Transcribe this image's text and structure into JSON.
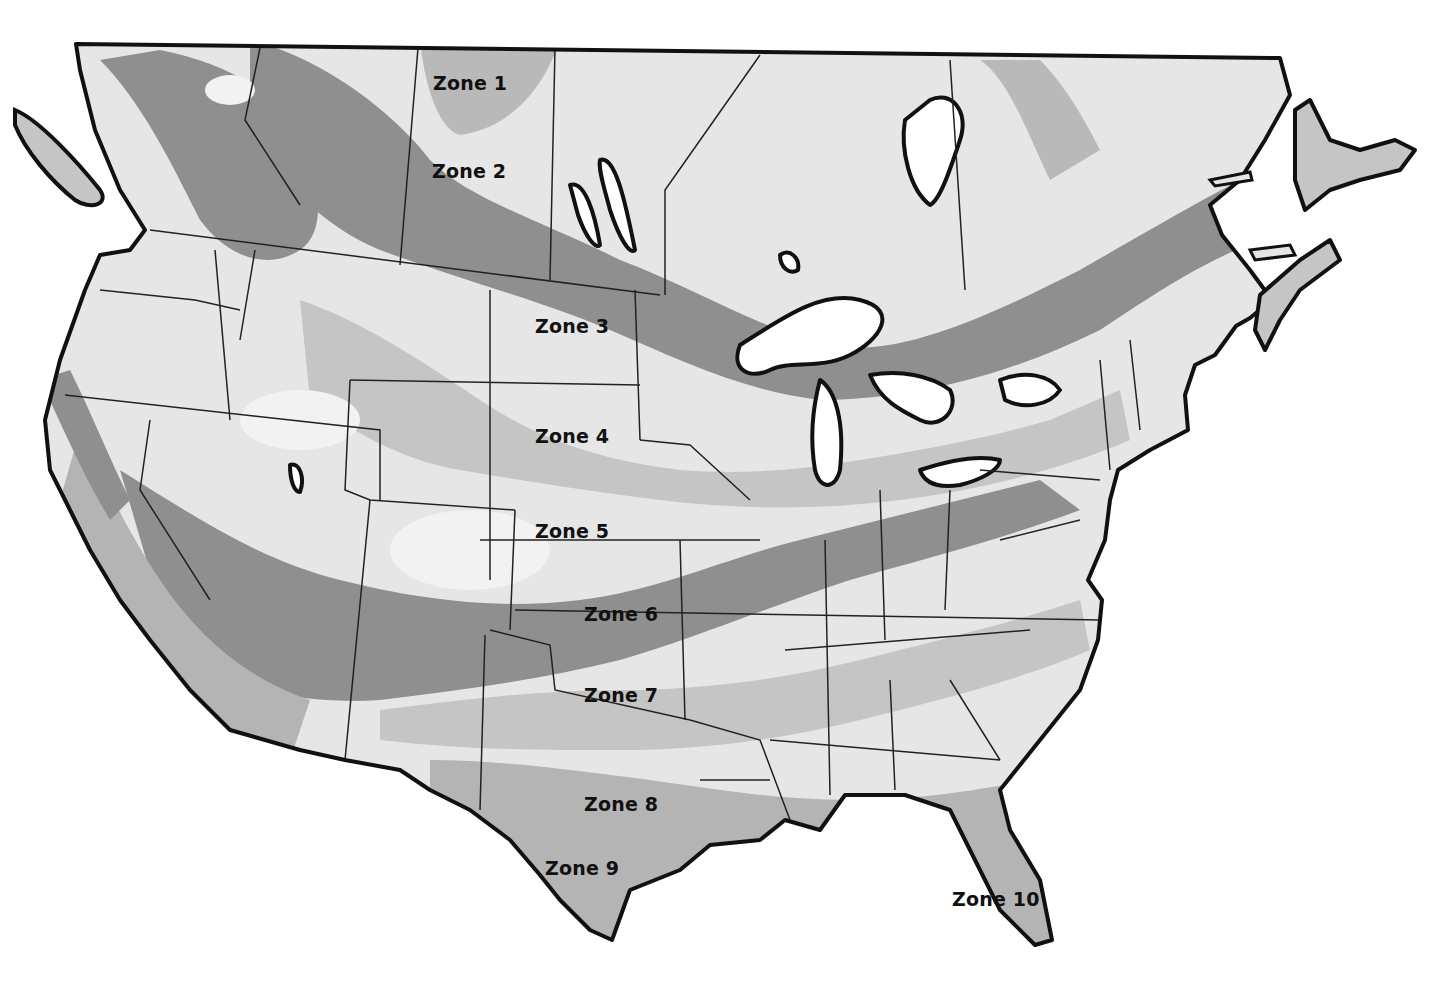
{
  "map": {
    "title": "Plant Hardiness Zone Map",
    "region": "United States and Southern Canada",
    "style": "grayscale",
    "colors": {
      "background": "#ffffff",
      "zone_light": "#e8e8e8",
      "zone_mid_light": "#c9c9c9",
      "zone_mid": "#b4b4b4",
      "zone_dark": "#8f8f8f",
      "water": "#ffffff",
      "border": "#111111"
    },
    "zones": [
      {
        "id": 1,
        "label": "Zone 1",
        "x": 433,
        "y": 72
      },
      {
        "id": 2,
        "label": "Zone 2",
        "x": 432,
        "y": 160
      },
      {
        "id": 3,
        "label": "Zone 3",
        "x": 535,
        "y": 315
      },
      {
        "id": 4,
        "label": "Zone 4",
        "x": 535,
        "y": 425
      },
      {
        "id": 5,
        "label": "Zone 5",
        "x": 535,
        "y": 520
      },
      {
        "id": 6,
        "label": "Zone 6",
        "x": 584,
        "y": 603
      },
      {
        "id": 7,
        "label": "Zone 7",
        "x": 584,
        "y": 684
      },
      {
        "id": 8,
        "label": "Zone 8",
        "x": 584,
        "y": 793
      },
      {
        "id": 9,
        "label": "Zone 9",
        "x": 545,
        "y": 857
      },
      {
        "id": 10,
        "label": "Zone 10",
        "x": 952,
        "y": 888
      }
    ]
  }
}
